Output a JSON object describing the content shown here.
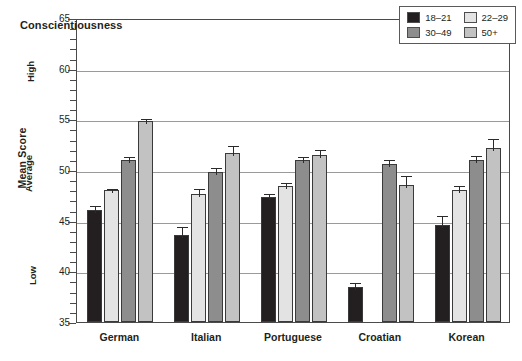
{
  "chart_data": {
    "type": "bar",
    "title": "Conscientiousness",
    "xlabel": "",
    "ylabel": "Mean Score",
    "ylim": [
      35,
      65
    ],
    "ytick_step": 5,
    "yticks": [
      35,
      40,
      45,
      50,
      55,
      60,
      65
    ],
    "ytick_labels": [
      "35",
      "40",
      "45",
      "50",
      "55",
      "60",
      "65"
    ],
    "y_anchor_labels": [
      {
        "text": "Low",
        "value": 40
      },
      {
        "text": "Average",
        "value": 50
      },
      {
        "text": "High",
        "value": 60
      }
    ],
    "grid": true,
    "grid_axis": "y",
    "legend_position": "top-right",
    "categories": [
      "German",
      "Italian",
      "Portuguese",
      "Croatian",
      "Korean"
    ],
    "series": [
      {
        "name": "18–21",
        "color": "#231f20",
        "values": [
          46.1,
          43.6,
          47.3,
          38.5,
          44.6
        ],
        "errors": [
          0.5,
          1.0,
          0.5,
          0.5,
          1.1
        ]
      },
      {
        "name": "22–29",
        "color": "#e3e3e3",
        "values": [
          48.0,
          47.6,
          48.4,
          null,
          48.0
        ],
        "errors": [
          0.3,
          0.7,
          0.5,
          null,
          0.6
        ]
      },
      {
        "name": "30–49",
        "color": "#8d8d8d",
        "values": [
          51.0,
          49.8,
          51.0,
          50.6,
          51.0
        ],
        "errors": [
          0.5,
          0.6,
          0.5,
          0.6,
          0.6
        ]
      },
      {
        "name": "50+",
        "color": "#c2c2c2",
        "values": [
          54.8,
          51.7,
          51.5,
          48.5,
          52.2
        ],
        "errors": [
          0.4,
          0.9,
          0.7,
          1.1,
          1.1
        ]
      }
    ]
  },
  "legend": {
    "entries": [
      "18–21",
      "22–29",
      "30–49",
      "50+"
    ]
  }
}
